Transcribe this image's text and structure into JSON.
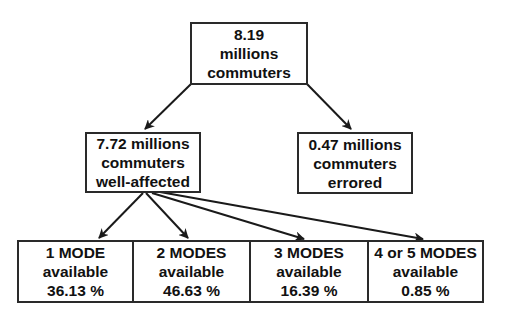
{
  "diagram": {
    "root": {
      "lines": [
        "8.19",
        "millions",
        "commuters"
      ]
    },
    "level2": [
      {
        "lines": [
          "7.72 millions",
          "commuters",
          "well-affected"
        ]
      },
      {
        "lines": [
          "0.47 millions",
          "commuters",
          "errored"
        ]
      }
    ],
    "level3": [
      {
        "lines": [
          "1 MODE",
          "available",
          "36.13 %"
        ]
      },
      {
        "lines": [
          "2 MODES",
          "available",
          "46.63 %"
        ]
      },
      {
        "lines": [
          "3 MODES",
          "available",
          "16.39 %"
        ]
      },
      {
        "lines": [
          "4 or 5 MODES",
          "available",
          "0.85 %"
        ]
      }
    ],
    "edges": [
      {
        "from": "root",
        "to": "well-affected"
      },
      {
        "from": "root",
        "to": "errored"
      },
      {
        "from": "well-affected",
        "to": "1-mode"
      },
      {
        "from": "well-affected",
        "to": "2-modes"
      },
      {
        "from": "well-affected",
        "to": "3-modes"
      },
      {
        "from": "well-affected",
        "to": "4-or-5-modes"
      }
    ],
    "colors": {
      "stroke": "#2a2a2a",
      "background": "#ffffff",
      "text": "#111111"
    }
  }
}
